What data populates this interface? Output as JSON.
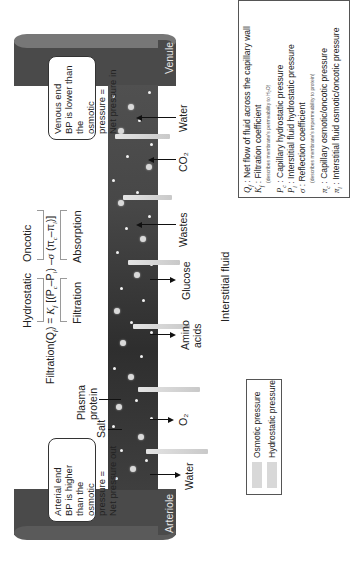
{
  "diagram": {
    "title_orientation": "rotated 90° counter-clockwise",
    "vessels": {
      "arteriole": "Arteriole",
      "venule": "Venule"
    },
    "equation": {
      "header_hydrostatic": "Hydrostatic",
      "header_oncotic": "Oncotic",
      "lhs": "Filtration(Q",
      "lhs_sub": "f",
      "lhs_end": ") = ",
      "kf": "K",
      "kf_sub": "f",
      "term1": " [(P",
      "pc_sub": "c",
      "minus": "–P",
      "pi_sub": "i",
      "term1_end": ") –",
      "sigma": "σ",
      "term2": " (π",
      "pic_sub": "c",
      "minus2": "–π",
      "pii_sub": "i",
      "term2_end": ")]",
      "footer_filtration": "Filtration",
      "footer_absorption": "Absorption"
    },
    "interstitial_label": "Interstitial fluid",
    "arterial_box": [
      "Arterial end",
      "BP is higher than the",
      "osmotic pressure =",
      "Net pressure out"
    ],
    "venous_box": [
      "Venous end",
      "BP is lower than the",
      "osmotic pressure =",
      "Net pressure in"
    ],
    "substances_out": [
      {
        "label": "Water",
        "lines": [
          "Water"
        ]
      },
      {
        "label": "O2",
        "lines": [
          "O₂"
        ]
      },
      {
        "label": "Amino acids",
        "lines": [
          "Amino",
          "acids"
        ]
      },
      {
        "label": "Glucose",
        "lines": [
          "Glucose"
        ]
      }
    ],
    "substances_in": [
      {
        "label": "Wastes",
        "lines": [
          "Wastes"
        ]
      },
      {
        "label": "CO2",
        "lines": [
          "CO₂"
        ]
      },
      {
        "label": "Water",
        "lines": [
          "Water"
        ]
      }
    ],
    "plasma_protein": [
      "Plasma",
      "protein"
    ],
    "salt": "Salt",
    "pressure_legend": {
      "osmotic": "Osmotic pressure",
      "hydrostatic": "Hydrostatic pressure"
    },
    "symbol_legend": [
      {
        "sym": "Q",
        "sub": "f",
        "text": " : Net flow of fluid across the capillary wall"
      },
      {
        "sym": "K",
        "sub": "f",
        "text": " : Filtration coefficient"
      },
      {
        "note": "(describes membrane's permeability to H₂O)"
      },
      {
        "sym": "P",
        "sub": "c",
        "text": " : Capillary hydrostatic pressure"
      },
      {
        "sym": "P",
        "sub": "i",
        "text": " : Interstitial fluid hydrostatic pressure"
      },
      {
        "sym": "σ",
        "sub": "",
        "text": " : Reflection coefficient"
      },
      {
        "note": "(describes membrane's impermeability to protein)"
      },
      {
        "sym": "π",
        "sub": "c",
        "text": " : Capillary osmotic/oncotic pressure"
      },
      {
        "sym": "π",
        "sub": "i",
        "text": " : Interstitial fluid osmotic/oncotic pressure"
      }
    ],
    "colors": {
      "vessel": "#4a4a4a",
      "capillary": "#3a3a3a",
      "pressure_bar": "#d4d4d4",
      "text": "#222222"
    }
  }
}
